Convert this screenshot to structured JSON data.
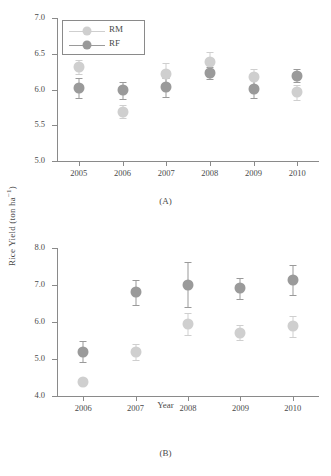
{
  "figure": {
    "ylabel_main": "Rice Yield (ton ha",
    "ylabel_sup": "−1",
    "ylabel_close": ")",
    "xaxis_title": "Year"
  },
  "legend": {
    "position": "top-left",
    "items": [
      {
        "label": "RM",
        "color": "#cfcfcf"
      },
      {
        "label": "RF",
        "color": "#9a9a9a"
      }
    ]
  },
  "panels": [
    {
      "caption": "(A)"
    },
    {
      "caption": "(B)"
    }
  ],
  "colors": {
    "rm": "#cfcfcf",
    "rf": "#9a9a9a",
    "axis": "#8a8a8a",
    "text": "#4a4a4a",
    "background": "#ffffff"
  },
  "chart_data": [
    {
      "type": "scatter",
      "panel": "(A)",
      "title": "",
      "xlabel": "",
      "ylabel": "Rice Yield (ton ha−1)",
      "categories": [
        "2005",
        "2006",
        "2007",
        "2008",
        "2009",
        "2010"
      ],
      "x": [
        2005,
        2006,
        2007,
        2008,
        2009,
        2010
      ],
      "xlim": [
        2004.5,
        2010.5
      ],
      "ylim": [
        5.0,
        7.0
      ],
      "yticks": [
        "5.0",
        "5.5",
        "6.0",
        "6.5",
        "7.0"
      ],
      "ytick_values": [
        5.0,
        5.5,
        6.0,
        6.5,
        7.0
      ],
      "grid": false,
      "legend_position": "upper left",
      "series": [
        {
          "name": "RM",
          "color": "#cfcfcf",
          "values": [
            6.31,
            5.69,
            6.22,
            6.38,
            6.17,
            5.96
          ],
          "errors": [
            0.1,
            0.09,
            0.15,
            0.14,
            0.11,
            0.1
          ]
        },
        {
          "name": "RF",
          "color": "#9a9a9a",
          "values": [
            6.02,
            5.99,
            6.03,
            6.23,
            6.01,
            6.19
          ],
          "errors": [
            0.14,
            0.12,
            0.13,
            0.09,
            0.13,
            0.09
          ]
        }
      ]
    },
    {
      "type": "scatter",
      "panel": "(B)",
      "title": "",
      "xlabel": "Year",
      "ylabel": "Rice Yield (ton ha−1)",
      "categories": [
        "2006",
        "2007",
        "2008",
        "2009",
        "2010"
      ],
      "x": [
        2006,
        2007,
        2008,
        2009,
        2010
      ],
      "xlim": [
        2005.5,
        2010.5
      ],
      "ylim": [
        4.0,
        8.0
      ],
      "yticks": [
        "4.0",
        "5.0",
        "6.0",
        "7.0",
        "8.0"
      ],
      "ytick_values": [
        4.0,
        5.0,
        6.0,
        7.0,
        8.0
      ],
      "grid": false,
      "legend_position": "none",
      "series": [
        {
          "name": "RM",
          "color": "#cfcfcf",
          "values": [
            4.38,
            5.18,
            5.94,
            5.71,
            5.88
          ],
          "errors": [
            0.07,
            0.22,
            0.3,
            0.2,
            0.28
          ]
        },
        {
          "name": "RF",
          "color": "#9a9a9a",
          "values": [
            5.2,
            6.8,
            7.01,
            6.91,
            7.14
          ],
          "errors": [
            0.28,
            0.33,
            0.6,
            0.28,
            0.4
          ]
        }
      ]
    }
  ]
}
